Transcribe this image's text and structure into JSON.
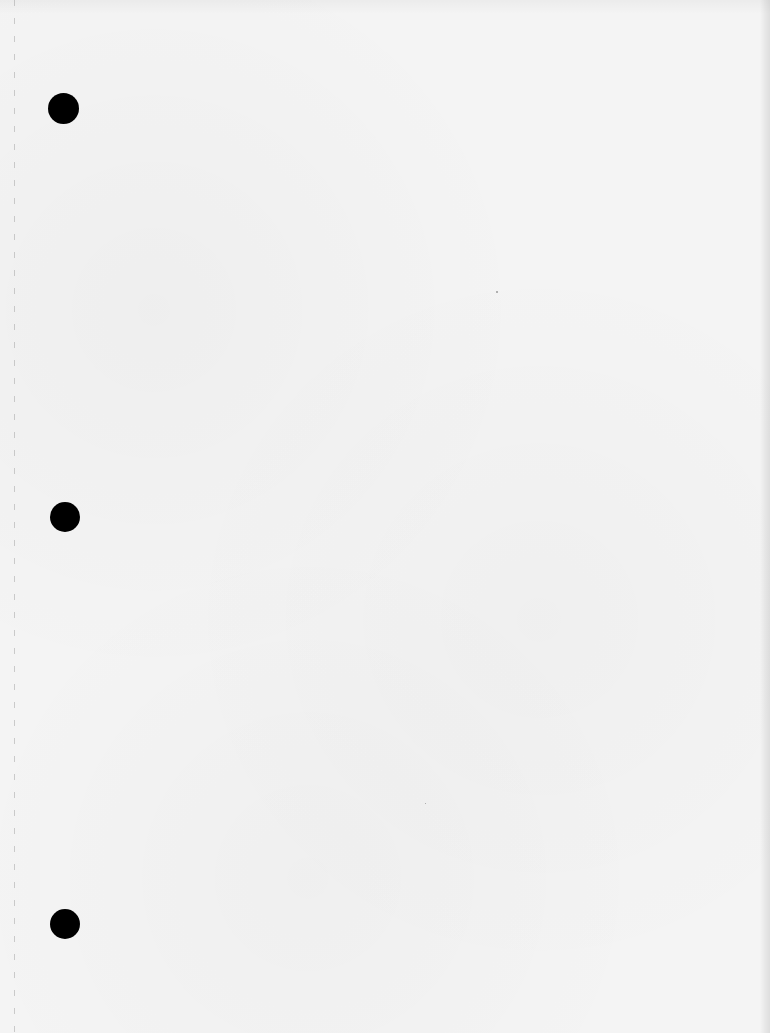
{
  "document": {
    "type": "blank three-hole punched sheet",
    "background_color": "#f4f4f4",
    "text_content": []
  },
  "punch_holes": [
    {
      "label": "top",
      "cx": 63,
      "cy": 108,
      "diameter": 31,
      "color": "#000000"
    },
    {
      "label": "middle",
      "cx": 65,
      "cy": 517,
      "diameter": 30,
      "color": "#000000"
    },
    {
      "label": "bottom",
      "cx": 65,
      "cy": 924,
      "diameter": 30,
      "color": "#000000"
    }
  ],
  "margin_line": {
    "x": 14,
    "style": "dashed",
    "color": "#969696"
  }
}
